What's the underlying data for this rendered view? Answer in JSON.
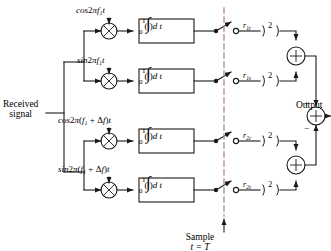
{
  "diagram": {
    "input_label_line1": "Received",
    "input_label_line2": "signal",
    "output_label": "Output",
    "sample_label_line1": "Sample",
    "sample_label_line2": "t = T",
    "multiplier_glyph": "×",
    "adder_glyph": "+",
    "plus_sign": "+",
    "minus_sign": "−",
    "square_exponent": "2",
    "integrator_upper_limit": "T",
    "integrator_lower_limit": "0",
    "integrator_body": "( ) d t",
    "integrator_symbol": "∫",
    "branches": [
      {
        "id": "branch-1c",
        "carrier": "cos 2πf₁t",
        "carrier_parts": {
          "fn": "cos",
          "factor": "2π",
          "freq": "f",
          "freq_sub": "1",
          "time": "t"
        },
        "signal_label": "r",
        "signal_sub": "1c",
        "square_label": "2"
      },
      {
        "id": "branch-1s",
        "carrier": "sin 2πf₁t",
        "carrier_parts": {
          "fn": "sin",
          "factor": "2π",
          "freq": "f",
          "freq_sub": "1",
          "time": "t"
        },
        "signal_label": "r",
        "signal_sub": "1s",
        "square_label": "2"
      },
      {
        "id": "branch-2c",
        "carrier": "cos 2π(f₁ + Δf)t",
        "carrier_parts": {
          "fn": "cos",
          "factor": "2π",
          "freq": "f",
          "freq_sub": "1",
          "delta": "+ Δf",
          "time": "t"
        },
        "signal_label": "r",
        "signal_sub": "2c",
        "square_label": "2"
      },
      {
        "id": "branch-2s",
        "carrier": "sin 2π(f₁ + Δf)t",
        "carrier_parts": {
          "fn": "sin",
          "factor": "2π",
          "freq": "f",
          "freq_sub": "1",
          "delta": "+ Δf",
          "time": "t"
        },
        "signal_label": "r",
        "signal_sub": "2s",
        "square_label": "2"
      }
    ],
    "colors": {
      "line": "#1a1a1a",
      "sample_line": "#c08a96",
      "background": "#ffffff",
      "text": "#000000"
    }
  }
}
